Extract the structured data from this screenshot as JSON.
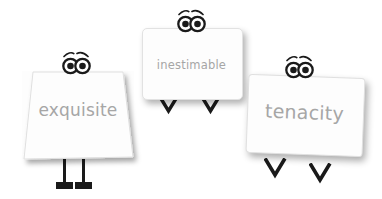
{
  "scene": {
    "title": "Three vocabulary flashcard characters",
    "background_color": "#ffffff",
    "text_color": "#a6a6a6",
    "ink_color": "#1a1a1a"
  },
  "characters": [
    {
      "id": "exquisite",
      "word": "exquisite",
      "card_shape": "trapezoid",
      "leg_style": "straight-legs-with-flat-feet",
      "eyes_icon": "eyes-with-eyebrows-icon",
      "font_size_px": 17
    },
    {
      "id": "inestimable",
      "word": "inestimable",
      "card_shape": "rounded-rectangle",
      "leg_style": "v-shaped-legs",
      "eyes_icon": "eyes-with-eyebrows-icon",
      "font_size_px": 12
    },
    {
      "id": "tenacity",
      "word": "tenacity",
      "card_shape": "rotated-rectangle",
      "leg_style": "v-shaped-legs",
      "eyes_icon": "eyes-with-eyebrows-icon",
      "font_size_px": 19
    }
  ]
}
